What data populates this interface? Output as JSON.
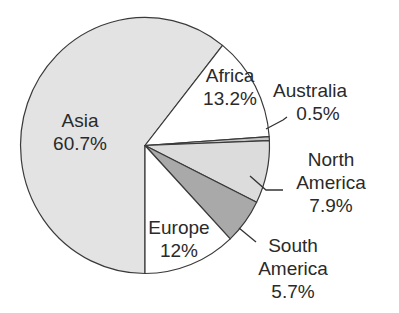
{
  "chart_data": {
    "type": "pie",
    "title": "",
    "categories": [
      "Asia",
      "Africa",
      "Australia",
      "North America",
      "South America",
      "Europe"
    ],
    "values": [
      60.7,
      13.2,
      0.5,
      7.9,
      5.7,
      12
    ],
    "value_labels": [
      "60.7%",
      "13.2%",
      "0.5%",
      "7.9%",
      "5.7%",
      "12%"
    ],
    "colors": [
      "#e3e3e3",
      "#ffffff",
      "#c4c4c4",
      "#dcdcdc",
      "#a9a9a9",
      "#ffffff"
    ],
    "start_angle_deg_clockwise_from_north": 180,
    "legend": "none",
    "labels_position": "inside for Asia/Africa/Europe, outside with leader lines for Australia/North America/South America"
  },
  "labels": {
    "asia": {
      "name": "Asia",
      "value": "60.7%"
    },
    "africa": {
      "name": "Africa",
      "value": "13.2%"
    },
    "australia": {
      "name": "Australia",
      "value": "0.5%"
    },
    "north_america": {
      "name1": "North",
      "name2": "America",
      "value": "7.9%"
    },
    "south_america": {
      "name1": "South",
      "name2": "America",
      "value": "5.7%"
    },
    "europe": {
      "name": "Europe",
      "value": "12%"
    }
  }
}
